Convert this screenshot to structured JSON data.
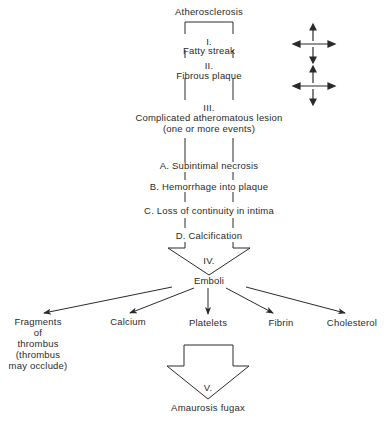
{
  "title": "Atherosclerosis",
  "stages": [
    {
      "numeral": "I.",
      "label": "Fatty streak"
    },
    {
      "numeral": "II.",
      "label": "Fibrous plaque"
    },
    {
      "numeral": "III.",
      "label": "Complicated atheromatous lesion",
      "sublabel": "(one or more events)"
    }
  ],
  "events": [
    "A. Subintimal necrosis",
    "B. Hemorrhage into plaque",
    "C. Loss of continuity in intima",
    "D. Calcification"
  ],
  "stage4": {
    "numeral": "IV.",
    "label": "Emboli"
  },
  "emboli_types": [
    {
      "line1": "Fragments",
      "line2": "of",
      "line3": "thrombus",
      "line4": "(thrombus",
      "line5": "may occlude)"
    },
    {
      "line1": "Calcium"
    },
    {
      "line1": "Platelets"
    },
    {
      "line1": "Fibrin"
    },
    {
      "line1": "Cholesterol"
    }
  ],
  "stage5": {
    "numeral": "V.",
    "label": "Amaurosis fugax"
  },
  "side_icons": [
    "reversible-arrows-icon",
    "reversible-arrows-icon"
  ],
  "colors": {
    "line": "#2a2a2a",
    "background": "#ffffff"
  }
}
